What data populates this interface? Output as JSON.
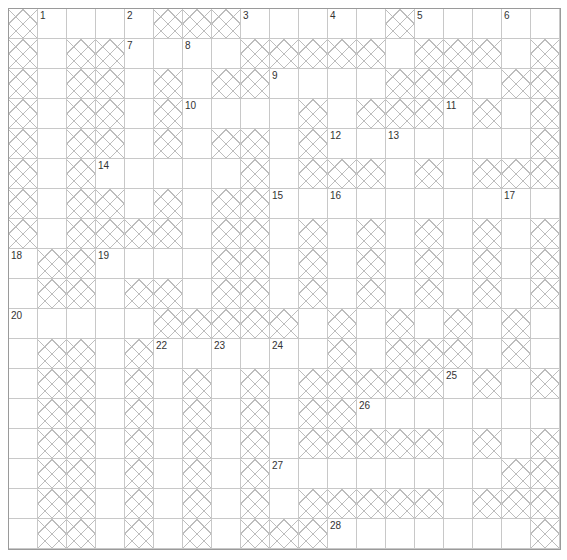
{
  "puzzle": {
    "type": "crossword",
    "cols": 19,
    "rows": 18,
    "legend": {
      "#": "blocked-cell",
      ".": "open-cell"
    },
    "grid": [
      "#....###.....#.....",
      "#.##....#####.###.#",
      "#.##.#.##....###.##",
      "#.##.#....#.###.#.#",
      "#.##.#.##.#.......#",
      "#.#.....#.###.#.###",
      "#.##.#.##.........",
      "#.####.##.#.#.#.#.#",
      ".##....##.#.#.#.#.#",
      ".##.##.##.#.#.#.#.#",
      ".....#####.#.#.#.#",
      ".##.#......#.###.#",
      ".##.#.#.#.#####.#.#",
      ".##.#.#.#.##.......",
      ".##.#.#.#.#####.#.#",
      ".##.#.#.#........##",
      ".##.#.#.#.#####.###",
      ".##.#.#.###.......##"
    ],
    "numbers": [
      {
        "n": "1",
        "row": 0,
        "col": 1
      },
      {
        "n": "2",
        "row": 0,
        "col": 4
      },
      {
        "n": "3",
        "row": 0,
        "col": 8
      },
      {
        "n": "4",
        "row": 0,
        "col": 11
      },
      {
        "n": "5",
        "row": 0,
        "col": 14
      },
      {
        "n": "6",
        "row": 0,
        "col": 17
      },
      {
        "n": "7",
        "row": 1,
        "col": 4
      },
      {
        "n": "8",
        "row": 1,
        "col": 6
      },
      {
        "n": "9",
        "row": 2,
        "col": 9
      },
      {
        "n": "10",
        "row": 3,
        "col": 6
      },
      {
        "n": "11",
        "row": 3,
        "col": 15
      },
      {
        "n": "12",
        "row": 4,
        "col": 11
      },
      {
        "n": "13",
        "row": 4,
        "col": 13
      },
      {
        "n": "14",
        "row": 5,
        "col": 3
      },
      {
        "n": "15",
        "row": 6,
        "col": 9
      },
      {
        "n": "16",
        "row": 6,
        "col": 11
      },
      {
        "n": "17",
        "row": 6,
        "col": 17
      },
      {
        "n": "18",
        "row": 8,
        "col": 0
      },
      {
        "n": "19",
        "row": 8,
        "col": 3
      },
      {
        "n": "20",
        "row": 10,
        "col": 0
      },
      {
        "n": "21",
        "row": 10,
        "col": 5
      },
      {
        "n": "22",
        "row": 11,
        "col": 5
      },
      {
        "n": "23",
        "row": 11,
        "col": 7
      },
      {
        "n": "24",
        "row": 11,
        "col": 9
      },
      {
        "n": "25",
        "row": 12,
        "col": 15
      },
      {
        "n": "26",
        "row": 13,
        "col": 12
      },
      {
        "n": "27",
        "row": 15,
        "col": 9
      },
      {
        "n": "28",
        "row": 17,
        "col": 11
      }
    ],
    "colors": {
      "background": "#ffffff",
      "grid_line": "#c8c8c8",
      "border": "#9a9a9a",
      "hatch": "#bdbdbd",
      "number_text": "#333333"
    }
  }
}
